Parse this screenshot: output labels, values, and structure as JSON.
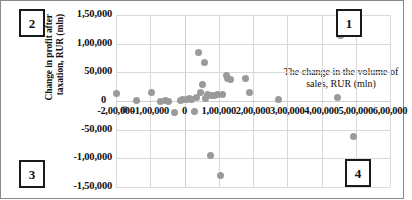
{
  "chart_data": {
    "type": "scatter",
    "title": "",
    "xlabel": "The change in the volume of sales, RUR (mln)",
    "ylabel_line1": "Change in profit after",
    "ylabel_line2": "taxation, RUR (mln)",
    "xlim": [
      -200000,
      600000
    ],
    "ylim": [
      -150000,
      150000
    ],
    "grid": true,
    "legend": "none",
    "xticks": [
      {
        "value": -200000,
        "label": "-2,00,000"
      },
      {
        "value": -100000,
        "label": "-1,00,000"
      },
      {
        "value": 0,
        "label": "0"
      },
      {
        "value": 100000,
        "label": "1,00,000"
      },
      {
        "value": 200000,
        "label": "2,00,000"
      },
      {
        "value": 300000,
        "label": "3,00,000"
      },
      {
        "value": 400000,
        "label": "4,00,000"
      },
      {
        "value": 500000,
        "label": "5,00,000"
      },
      {
        "value": 600000,
        "label": "6,00,000"
      }
    ],
    "yticks": [
      {
        "value": 150000,
        "label": "1,50,000"
      },
      {
        "value": 100000,
        "label": "1,00,000"
      },
      {
        "value": 50000,
        "label": "50,000"
      },
      {
        "value": 0,
        "label": "0"
      },
      {
        "value": -50000,
        "label": "-50,000"
      },
      {
        "value": -100000,
        "label": "-1,00,000"
      },
      {
        "value": -150000,
        "label": "-1,50,000"
      }
    ],
    "marker_color": "#9a9a9a",
    "points": [
      {
        "x": -198000,
        "y": 13000
      },
      {
        "x": -175000,
        "y": -15000
      },
      {
        "x": -140000,
        "y": 1000
      },
      {
        "x": -95000,
        "y": 14000
      },
      {
        "x": -70000,
        "y": 0
      },
      {
        "x": -55000,
        "y": 1000
      },
      {
        "x": -48000,
        "y": -1000
      },
      {
        "x": -30000,
        "y": -20000
      },
      {
        "x": -12000,
        "y": 1000
      },
      {
        "x": -5000,
        "y": 2000
      },
      {
        "x": 5000,
        "y": 3000
      },
      {
        "x": 14000,
        "y": 4000
      },
      {
        "x": 20000,
        "y": 2000
      },
      {
        "x": 28000,
        "y": -19000
      },
      {
        "x": 35000,
        "y": 6000
      },
      {
        "x": 40000,
        "y": 85000
      },
      {
        "x": 48000,
        "y": 14000
      },
      {
        "x": 52000,
        "y": 28000
      },
      {
        "x": 58000,
        "y": 68000
      },
      {
        "x": 60000,
        "y": 5000
      },
      {
        "x": 68000,
        "y": 12000
      },
      {
        "x": 75000,
        "y": -95000
      },
      {
        "x": 80000,
        "y": 9000
      },
      {
        "x": 88000,
        "y": 10000
      },
      {
        "x": 96000,
        "y": 11000
      },
      {
        "x": 105000,
        "y": -130000
      },
      {
        "x": 112000,
        "y": 12000
      },
      {
        "x": 122000,
        "y": 44000
      },
      {
        "x": 126000,
        "y": 40000
      },
      {
        "x": 135000,
        "y": 38000
      },
      {
        "x": 178000,
        "y": 40000
      },
      {
        "x": 190000,
        "y": 15000
      },
      {
        "x": 275000,
        "y": 2000
      },
      {
        "x": 448000,
        "y": 6000
      },
      {
        "x": 455000,
        "y": 115000
      },
      {
        "x": 493000,
        "y": -62000
      }
    ]
  },
  "quadrants": [
    {
      "id": "1",
      "label": "1",
      "position": "top-right"
    },
    {
      "id": "2",
      "label": "2",
      "position": "top-left"
    },
    {
      "id": "3",
      "label": "3",
      "position": "bottom-left"
    },
    {
      "id": "4",
      "label": "4",
      "position": "bottom-right"
    }
  ]
}
